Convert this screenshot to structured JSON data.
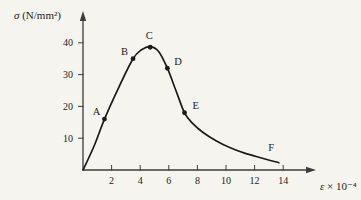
{
  "figure": {
    "background": "#f6f4ee",
    "ink_color": "#1b1b1b",
    "axis_color": "#3c3c3c",
    "curve_color": "#1b1b1b"
  },
  "chart_data": {
    "type": "line",
    "title": "",
    "xlabel": "ε × 10⁻⁴",
    "xlabel_symbol": "ε",
    "xlabel_suffix": " × 10⁻⁴",
    "ylabel": "σ (N/mm²)",
    "ylabel_symbol": "σ",
    "ylabel_units": " (N/mm²)",
    "xlim": [
      0,
      16
    ],
    "ylim": [
      0,
      45
    ],
    "x_ticks": [
      2,
      4,
      6,
      8,
      10,
      12,
      14
    ],
    "y_ticks": [
      10,
      20,
      30,
      40
    ],
    "grid": false,
    "legend": null,
    "curve": {
      "x": [
        0,
        0.8,
        1.5,
        2.5,
        3.5,
        4.1,
        4.7,
        5.3,
        5.9,
        6.5,
        7.1,
        7.7,
        8.4,
        9.3,
        10.3,
        11.3,
        12.3,
        13.1,
        13.7
      ],
      "y": [
        0,
        7.8,
        16,
        26,
        35,
        37.8,
        38.8,
        37.2,
        32,
        25,
        18,
        14.5,
        11.8,
        9.2,
        7,
        5.3,
        4,
        3,
        2.3
      ]
    },
    "labeled_points": [
      {
        "label": "A",
        "x": 1.5,
        "y": 16,
        "marker": true
      },
      {
        "label": "B",
        "x": 3.5,
        "y": 35,
        "marker": true
      },
      {
        "label": "C",
        "x": 4.7,
        "y": 38.6,
        "marker": true
      },
      {
        "label": "D",
        "x": 5.9,
        "y": 32,
        "marker": true
      },
      {
        "label": "E",
        "x": 7.1,
        "y": 18,
        "marker": true
      },
      {
        "label": "F",
        "x": 13.5,
        "y": 3,
        "marker": false
      }
    ]
  }
}
